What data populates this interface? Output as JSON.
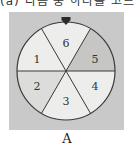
{
  "top_text_partial": "(a) 다음 중 하나를 고르면?",
  "figure": {
    "label": "A",
    "pointer": "triangle-pointer",
    "colors": {
      "panel": "#c9c9c9",
      "light": "#ededeb",
      "medium": "#dcdcda",
      "dark": "#c6c6c4",
      "line": "#3a3a3a"
    },
    "sectors": [
      {
        "number": "6",
        "shade": "light"
      },
      {
        "number": "5",
        "shade": "dark"
      },
      {
        "number": "4",
        "shade": "light"
      },
      {
        "number": "3",
        "shade": "light"
      },
      {
        "number": "2",
        "shade": "medium"
      },
      {
        "number": "1",
        "shade": "light"
      }
    ]
  }
}
